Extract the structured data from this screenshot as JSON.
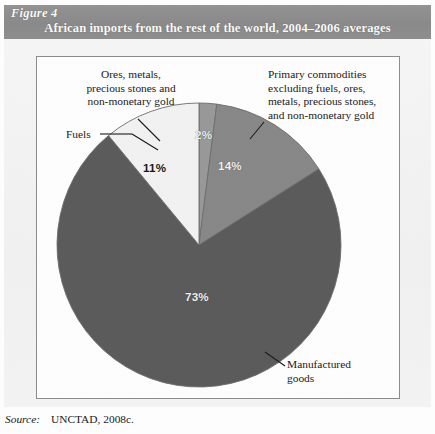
{
  "figure": {
    "number_label": "Figure 4",
    "title": "African imports from the rest of the world, 2004–2006 averages",
    "header_bg": "#8e8e8e",
    "header_text_color": "#ffffff",
    "panel_bg": "#f4f4f4",
    "plot_bg": "#ffffff",
    "plot_border": "#8d8d8d"
  },
  "labels": {
    "ores": "Ores, metals,\nprecious stones and\nnon-monetary gold",
    "fuels": "Fuels",
    "primary": "Primary commodities\nexcluding fuels, ores,\nmetals, precious stones,\nand non-monetary gold",
    "manufactured": "Manufactured\ngoods"
  },
  "values": {
    "ores_pct": "2%",
    "primary_pct": "14%",
    "fuels_pct": "11%",
    "manufactured_pct": "73%"
  },
  "source": {
    "lead": "Source:",
    "value": "UNCTAD, 2008c."
  },
  "chart_data": {
    "type": "pie",
    "title": "African imports from the rest of the world, 2004–2006 averages",
    "subtitle": "",
    "xlabel": "",
    "ylabel": "",
    "unit": "percent of total imports",
    "legend_position": "callout-labels",
    "grid": false,
    "start_angle_deg": 0,
    "direction": "clockwise",
    "categories": [
      "Ores, metals, precious stones and non-monetary gold",
      "Primary commodities excluding fuels, ores, metals, precious stones, and non-monetary gold",
      "Manufactured goods",
      "Fuels"
    ],
    "values": [
      2,
      14,
      73,
      11
    ],
    "data_labels": [
      "2%",
      "14%",
      "73%",
      "11%"
    ],
    "colors": [
      "#9a9a9a",
      "#898989",
      "#5c5c5c",
      "#f3f3f3"
    ],
    "label_text_colors": [
      "#f2f2f2",
      "#f2f2f2",
      "#f2f2f2",
      "#1a1a1a"
    ],
    "slice_border_color": "#6e6e6e",
    "total": 100,
    "source": "UNCTAD, 2008c."
  }
}
